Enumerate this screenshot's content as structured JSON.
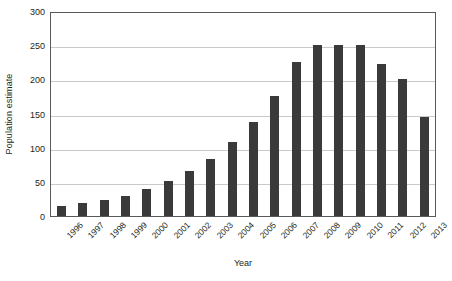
{
  "chart_data": {
    "type": "bar",
    "title": "",
    "xlabel": "Year",
    "ylabel": "Population estimate",
    "categories": [
      "1996",
      "1997",
      "1998",
      "1999",
      "2000",
      "2001",
      "2002",
      "2003",
      "2004",
      "2005",
      "2006",
      "2007",
      "2008",
      "2009",
      "2010",
      "2011",
      "2012",
      "2013"
    ],
    "values": [
      15,
      19,
      24,
      30,
      40,
      51,
      66,
      84,
      108,
      138,
      176,
      226,
      250,
      250,
      250,
      222,
      201,
      145
    ],
    "ylim": [
      0,
      300
    ],
    "ytick_values": [
      0,
      50,
      100,
      150,
      200,
      250,
      300
    ],
    "ytick_labels": [
      "0",
      "50",
      "100",
      "150",
      "200",
      "250",
      "300"
    ],
    "grid": "horizontal",
    "legend": "none",
    "series": [
      {
        "name": "Population estimate",
        "values": [
          15,
          19,
          24,
          30,
          40,
          51,
          66,
          84,
          108,
          138,
          176,
          226,
          250,
          250,
          250,
          222,
          201,
          145
        ]
      }
    ]
  },
  "style": {
    "bar_color": "#3a3a3a",
    "gridline_color": "#c8c9cb",
    "axis_color": "#58595b",
    "text_color": "#231f20",
    "background": "#ffffff"
  }
}
